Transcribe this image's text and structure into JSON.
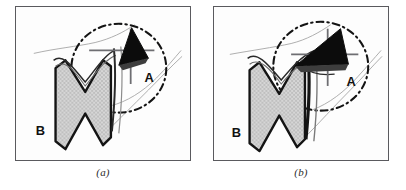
{
  "figure": {
    "type": "two-panel-scientific-diagram",
    "background_color": "#ffffff",
    "frame_color": "#5a5a5e",
    "panel_background": "#fdfdfd"
  },
  "colors": {
    "black_lesion": "#0c0c0c",
    "stipple_fill": "#d3d3d3",
    "stipple_dot": "#9a9a9a",
    "outline_dark": "#1a1a1a",
    "contour_thin": "#9b9b9b",
    "caliper": "#6e6e72",
    "dashdot_circle": "#1a1a1a"
  },
  "panels": [
    {
      "id": "a",
      "caption": "(a)",
      "labels": {
        "region_a": "A",
        "region_b": "B"
      },
      "annotations": {
        "dashdot_circle": "region-of-interest-circle",
        "caliper_horizontal": "caliper-horizontal",
        "caliper_vertical": "caliper-vertical",
        "black_shape": "filled-triangular-lesion",
        "stipple_shape": "stippled-zigzag-structure"
      }
    },
    {
      "id": "b",
      "caption": "(b)",
      "labels": {
        "region_a": "A",
        "region_b": "B"
      },
      "annotations": {
        "dashdot_circle": "region-of-interest-circle",
        "caliper_horizontal": "caliper-horizontal",
        "caliper_vertical": "caliper-vertical",
        "black_shape": "filled-triangular-lesion",
        "stipple_shape": "stippled-zigzag-structure"
      }
    }
  ]
}
